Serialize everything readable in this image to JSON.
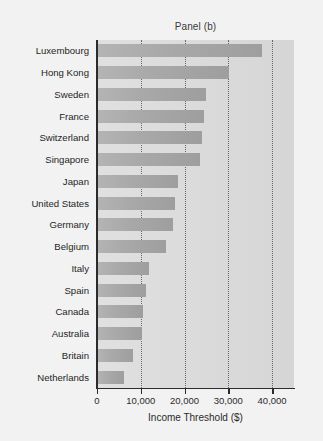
{
  "chart_data": {
    "type": "bar",
    "orientation": "horizontal",
    "title": "Panel (b)",
    "xlabel": "Income Threshold ($)",
    "ylabel": "",
    "xlim": [
      0,
      45000
    ],
    "xticks": [
      0,
      10000,
      20000,
      30000,
      40000
    ],
    "xticklabels": [
      "0",
      "10,000",
      "20,000",
      "30,000",
      "40,000"
    ],
    "grid": "vertical-dotted",
    "legend": "none",
    "categories": [
      "Luxembourg",
      "Hong Kong",
      "Sweden",
      "France",
      "Switzerland",
      "Singapore",
      "Japan",
      "United States",
      "Germany",
      "Belgium",
      "Italy",
      "Spain",
      "Canada",
      "Australia",
      "Britain",
      "Netherlands"
    ],
    "values": [
      37600,
      30100,
      25000,
      24500,
      24000,
      23500,
      18400,
      17800,
      17300,
      15700,
      11800,
      11200,
      10600,
      10200,
      8200,
      6100
    ],
    "colors": {
      "bar_light": "#b4b4b4",
      "bar_dark": "#9e9e9e",
      "plot_background": "#dcdcdc",
      "figure_background": "#f2f2f2",
      "axis": "#2b2b2b",
      "gridline": "#555555",
      "text": "#1f1f1f"
    }
  }
}
